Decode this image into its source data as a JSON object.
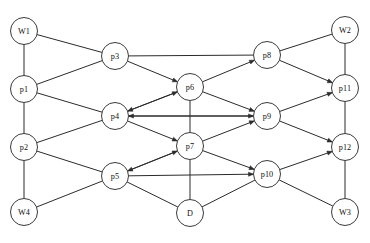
{
  "diagram": {
    "style": {
      "background": "#ffffff",
      "edge_color": "#2b2b2b",
      "node_fill": "#ffffff",
      "node_stroke": "#3a3a3a",
      "label_color": "#111111",
      "node_radius": 13.5,
      "arrow_size": 5
    },
    "nodes": [
      {
        "id": "W1",
        "label": "W1",
        "x": 24,
        "y": 31,
        "column": "left"
      },
      {
        "id": "p1",
        "label": "p1",
        "x": 24,
        "y": 89,
        "column": "left"
      },
      {
        "id": "p2",
        "label": "p2",
        "x": 24,
        "y": 147,
        "column": "left"
      },
      {
        "id": "W4",
        "label": "W4",
        "x": 24,
        "y": 212,
        "column": "left"
      },
      {
        "id": "p3",
        "label": "p3",
        "x": 115,
        "y": 56,
        "column": "inner-left"
      },
      {
        "id": "p4",
        "label": "p4",
        "x": 115,
        "y": 116,
        "column": "inner-left"
      },
      {
        "id": "p5",
        "label": "p5",
        "x": 115,
        "y": 176,
        "column": "inner-left"
      },
      {
        "id": "p6",
        "label": "p6",
        "x": 190,
        "y": 87,
        "column": "center"
      },
      {
        "id": "p7",
        "label": "p7",
        "x": 190,
        "y": 146,
        "column": "center"
      },
      {
        "id": "D",
        "label": "D",
        "x": 190,
        "y": 213,
        "column": "center"
      },
      {
        "id": "p8",
        "label": "p8",
        "x": 267,
        "y": 55,
        "column": "inner-right"
      },
      {
        "id": "p9",
        "label": "p9",
        "x": 267,
        "y": 116,
        "column": "inner-right"
      },
      {
        "id": "p10",
        "label": "p10",
        "x": 267,
        "y": 174,
        "column": "inner-right"
      },
      {
        "id": "W2",
        "label": "W2",
        "x": 345,
        "y": 30,
        "column": "right"
      },
      {
        "id": "p11",
        "label": "p11",
        "x": 345,
        "y": 88,
        "column": "right"
      },
      {
        "id": "p12",
        "label": "p12",
        "x": 345,
        "y": 147,
        "column": "right"
      },
      {
        "id": "W3",
        "label": "W3",
        "x": 345,
        "y": 212,
        "column": "right"
      }
    ],
    "edges": [
      {
        "from": "W1",
        "to": "p1",
        "arrow": "none"
      },
      {
        "from": "p1",
        "to": "p2",
        "arrow": "none"
      },
      {
        "from": "p2",
        "to": "W4",
        "arrow": "none"
      },
      {
        "from": "W1",
        "to": "p3",
        "arrow": "none"
      },
      {
        "from": "p1",
        "to": "p3",
        "arrow": "none"
      },
      {
        "from": "p1",
        "to": "p4",
        "arrow": "none"
      },
      {
        "from": "p2",
        "to": "p4",
        "arrow": "none"
      },
      {
        "from": "p2",
        "to": "p5",
        "arrow": "none"
      },
      {
        "from": "W4",
        "to": "p5",
        "arrow": "none"
      },
      {
        "from": "p3",
        "to": "p8",
        "arrow": "none"
      },
      {
        "from": "p3",
        "to": "p6",
        "arrow": "forward"
      },
      {
        "from": "p4",
        "to": "p6",
        "arrow": "forward"
      },
      {
        "from": "p4",
        "to": "p9",
        "arrow": "forward"
      },
      {
        "from": "p4",
        "to": "p7",
        "arrow": "forward"
      },
      {
        "from": "p5",
        "to": "p7",
        "arrow": "forward"
      },
      {
        "from": "p5",
        "to": "p10",
        "arrow": "forward"
      },
      {
        "from": "p5",
        "to": "D",
        "arrow": "none"
      },
      {
        "from": "p6",
        "to": "p7",
        "arrow": "none"
      },
      {
        "from": "p7",
        "to": "D",
        "arrow": "none"
      },
      {
        "from": "p6",
        "to": "p8",
        "arrow": "forward"
      },
      {
        "from": "p6",
        "to": "p9",
        "arrow": "forward"
      },
      {
        "from": "p7",
        "to": "p9",
        "arrow": "forward"
      },
      {
        "from": "p7",
        "to": "p10",
        "arrow": "forward"
      },
      {
        "from": "D",
        "to": "p10",
        "arrow": "none"
      },
      {
        "from": "p9",
        "to": "p4",
        "arrow": "forward"
      },
      {
        "from": "p6",
        "to": "p4",
        "arrow": "forward"
      },
      {
        "from": "p7",
        "to": "p5",
        "arrow": "forward"
      },
      {
        "from": "p8",
        "to": "W2",
        "arrow": "none"
      },
      {
        "from": "p8",
        "to": "p11",
        "arrow": "forward"
      },
      {
        "from": "p9",
        "to": "p11",
        "arrow": "forward"
      },
      {
        "from": "p9",
        "to": "p12",
        "arrow": "forward"
      },
      {
        "from": "p10",
        "to": "p12",
        "arrow": "forward"
      },
      {
        "from": "p10",
        "to": "W3",
        "arrow": "none"
      },
      {
        "from": "W2",
        "to": "p11",
        "arrow": "none"
      },
      {
        "from": "p11",
        "to": "p12",
        "arrow": "none"
      },
      {
        "from": "p12",
        "to": "W3",
        "arrow": "none"
      }
    ]
  }
}
